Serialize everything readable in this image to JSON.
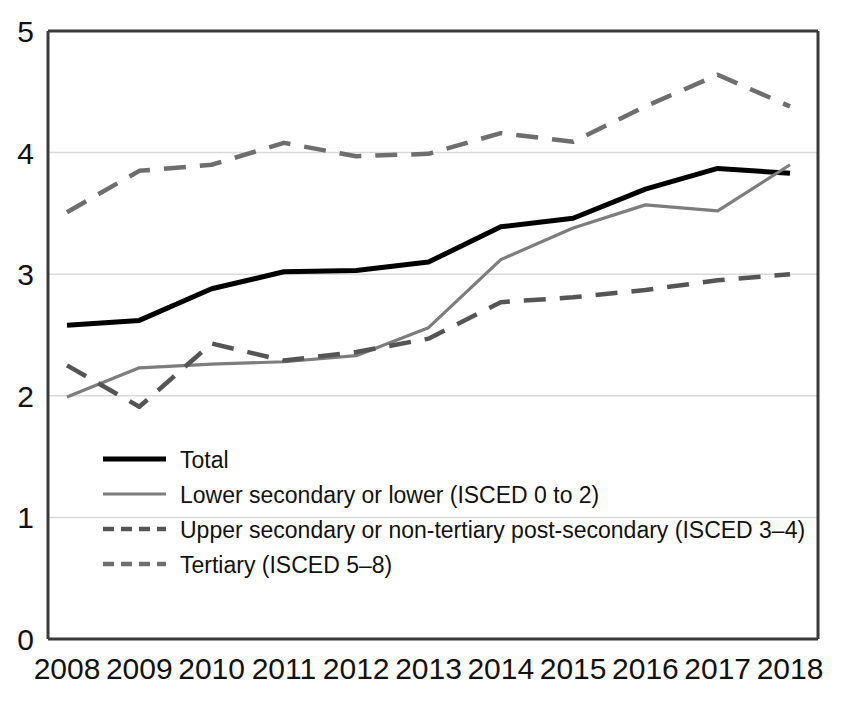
{
  "chart_data": {
    "type": "line",
    "title": "",
    "xlabel": "",
    "ylabel": "",
    "x": [
      2008,
      2009,
      2010,
      2011,
      2012,
      2013,
      2014,
      2015,
      2016,
      2017,
      2018
    ],
    "categories": [
      "2008",
      "2009",
      "2010",
      "2011",
      "2012",
      "2013",
      "2014",
      "2015",
      "2016",
      "2017",
      "2018"
    ],
    "xlim": [
      2008,
      2018
    ],
    "ylim": [
      0,
      5
    ],
    "yticks": [
      0,
      1,
      2,
      3,
      4,
      5
    ],
    "ytick_labels": [
      "0",
      "1",
      "2",
      "3",
      "4",
      "5"
    ],
    "grid": "horizontal",
    "legend_position": "inside-lower-left",
    "series": [
      {
        "name": "Total",
        "style": "solid",
        "color": "#000000",
        "values": [
          2.58,
          2.62,
          2.88,
          3.02,
          3.03,
          3.1,
          3.39,
          3.46,
          3.7,
          3.87,
          3.83
        ]
      },
      {
        "name": "Lower secondary or lower (ISCED 0 to 2)",
        "style": "solid",
        "color": "#7d7d7d",
        "values": [
          1.99,
          2.23,
          2.26,
          2.28,
          2.33,
          2.56,
          3.12,
          3.38,
          3.57,
          3.52,
          3.9
        ]
      },
      {
        "name": "Upper secondary or non-tertiary post-secondary (ISCED 3–4)",
        "style": "dashed",
        "color": "#555555",
        "values": [
          2.25,
          1.91,
          2.43,
          2.29,
          2.36,
          2.47,
          2.77,
          2.81,
          2.87,
          2.95,
          3.0
        ]
      },
      {
        "name": "Tertiary (ISCED 5–8)",
        "style": "dashed",
        "color": "#6e6e6e",
        "values": [
          3.51,
          3.85,
          3.9,
          4.08,
          3.97,
          3.99,
          4.16,
          4.09,
          4.38,
          4.64,
          4.38
        ]
      }
    ]
  },
  "legend": {
    "items": [
      {
        "label": "Total"
      },
      {
        "label": "Lower secondary or lower (ISCED 0 to 2)"
      },
      {
        "label": "Upper secondary or non-tertiary post-secondary (ISCED 3–4)"
      },
      {
        "label": "Tertiary (ISCED 5–8)"
      }
    ]
  },
  "colors": {
    "axis": "#3a3a3a",
    "grid": "#d9d9d9",
    "total": "#000000",
    "lower_secondary": "#7d7d7d",
    "upper_secondary": "#555555",
    "tertiary": "#6e6e6e",
    "background": "#ffffff"
  }
}
